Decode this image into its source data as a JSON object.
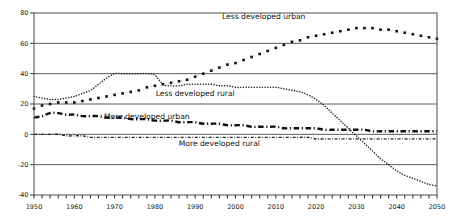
{
  "chart_data": {
    "type": "line",
    "title": "",
    "subtitle": "",
    "xlabel": "",
    "ylabel": "",
    "xlim": [
      1950,
      2050
    ],
    "ylim": [
      -40,
      80
    ],
    "grid": true,
    "legend_position": "inline-annotations",
    "y_ticks": [
      80,
      60,
      40,
      20,
      0,
      -20,
      -40
    ],
    "y_tick_labels": [
      "80",
      "60",
      "40",
      "20",
      "0",
      "-20",
      "-40"
    ],
    "x_ticks": [
      1950,
      1960,
      1970,
      1980,
      1990,
      2000,
      2010,
      2020,
      2030,
      2040,
      2050
    ],
    "x_tick_labels": [
      "1950",
      "1960",
      "1970",
      "1980",
      "1990",
      "2000",
      "2010",
      "2020",
      "2030",
      "2040",
      "2050"
    ],
    "x_minor_tick_step": 2,
    "x": [
      1950,
      1952,
      1954,
      1956,
      1958,
      1960,
      1962,
      1964,
      1966,
      1968,
      1970,
      1972,
      1974,
      1976,
      1978,
      1980,
      1982,
      1984,
      1986,
      1988,
      1990,
      1992,
      1994,
      1996,
      1998,
      2000,
      2002,
      2004,
      2006,
      2008,
      2010,
      2012,
      2014,
      2016,
      2018,
      2020,
      2022,
      2024,
      2026,
      2028,
      2030,
      2032,
      2034,
      2036,
      2038,
      2040,
      2042,
      2044,
      2046,
      2048,
      2050
    ],
    "series": [
      {
        "name": "Less developed urban",
        "label": "Less developed urban",
        "style": "dotted-square",
        "color": "#111111",
        "label_x": 2007,
        "label_y": 76,
        "values": [
          17,
          19,
          20,
          21,
          21,
          21,
          22,
          23,
          24,
          25,
          26,
          27,
          28,
          29,
          31,
          32,
          33,
          34,
          35,
          36,
          38,
          40,
          42,
          44,
          46,
          47,
          49,
          51,
          53,
          55,
          57,
          59,
          61,
          62,
          64,
          65,
          66,
          67,
          68,
          69,
          70,
          70,
          70,
          69,
          69,
          68,
          67,
          66,
          65,
          64,
          63
        ]
      },
      {
        "name": "Less developed rural",
        "label": "Less developed rural",
        "style": "fine-dotted",
        "color": "#222222",
        "label_x": 1990,
        "label_y": 25,
        "values": [
          25,
          24,
          23,
          23,
          24,
          25,
          27,
          29,
          33,
          37,
          40,
          40,
          40,
          40,
          40,
          39,
          33,
          32,
          32,
          33,
          33,
          33,
          33,
          32,
          32,
          31,
          31,
          31,
          31,
          31,
          31,
          30,
          29,
          28,
          26,
          23,
          19,
          14,
          9,
          4,
          -1,
          -6,
          -11,
          -16,
          -20,
          -24,
          -27,
          -29,
          -31,
          -33,
          -34
        ]
      },
      {
        "name": "More developed urban",
        "label": "More developed urban",
        "style": "dash-dot-thick",
        "color": "#111111",
        "label_x": 1978,
        "label_y": 10,
        "values": [
          11,
          12,
          14,
          14,
          13,
          13,
          12,
          12,
          12,
          11,
          11,
          11,
          10,
          10,
          10,
          9,
          9,
          9,
          8,
          8,
          8,
          7,
          7,
          7,
          6,
          6,
          6,
          5,
          5,
          5,
          5,
          4,
          4,
          4,
          4,
          4,
          3,
          3,
          3,
          3,
          3,
          3,
          2,
          2,
          2,
          2,
          2,
          2,
          2,
          2,
          2
        ]
      },
      {
        "name": "More developed rural",
        "label": "More developed rural",
        "style": "fine-dash-dot",
        "color": "#222222",
        "label_x": 1996,
        "label_y": -8,
        "values": [
          0,
          0,
          0,
          0,
          -1,
          -1,
          -1,
          -2,
          -2,
          -2,
          -2,
          -2,
          -2,
          -2,
          -2,
          -2,
          -2,
          -2,
          -2,
          -2,
          -2,
          -2,
          -2,
          -2,
          -2,
          -2,
          -2,
          -2,
          -2,
          -2,
          -2,
          -2,
          -2,
          -2,
          -2,
          -3,
          -3,
          -3,
          -3,
          -3,
          -3,
          -3,
          -3,
          -3,
          -3,
          -3,
          -3,
          -3,
          -3,
          -3,
          -3
        ]
      }
    ]
  },
  "plot": {
    "bg": "#ffffff",
    "frame_color": "#4a4a4a",
    "grid_color": "#4a4a4a"
  }
}
